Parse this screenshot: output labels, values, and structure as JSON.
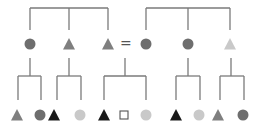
{
  "diagram": {
    "title": "",
    "colors": {
      "line": "#7a7a7a",
      "dark_gray": "#6e6e6e",
      "mid_gray": "#7f7f7f",
      "light_gray": "#c9c9c9",
      "black": "#1a1a1a",
      "outline": "#555555"
    },
    "equals_sign": "=",
    "top_brackets": [
      {
        "name": "left-group",
        "x1": 30,
        "x2": 108,
        "mid": 69,
        "y_top": 8,
        "y_bottom": 30
      },
      {
        "name": "right-group",
        "x1": 146,
        "x2": 230,
        "mid": 188,
        "y_top": 8,
        "y_bottom": 30
      }
    ],
    "middle_row": [
      {
        "shape": "circle",
        "color": "dark_gray",
        "x": 30,
        "y": 44
      },
      {
        "shape": "triangle",
        "color": "mid_gray",
        "x": 69,
        "y": 44
      },
      {
        "shape": "triangle",
        "color": "mid_gray",
        "x": 108,
        "y": 44
      },
      {
        "shape": "circle",
        "color": "dark_gray",
        "x": 146,
        "y": 44
      },
      {
        "shape": "circle",
        "color": "dark_gray",
        "x": 188,
        "y": 44
      },
      {
        "shape": "triangle",
        "color": "light_gray",
        "x": 230,
        "y": 44
      }
    ],
    "lower_brackets": [
      {
        "stem_x": 30,
        "x1": 18,
        "x2": 41
      },
      {
        "stem_x": 69,
        "x1": 57,
        "x2": 81
      },
      {
        "stem_x": 125,
        "x1": 104,
        "x2": 146
      },
      {
        "stem_x": 188,
        "x1": 176,
        "x2": 200
      },
      {
        "stem_x": 231,
        "x1": 220,
        "x2": 244
      }
    ],
    "bottom_row": [
      {
        "shape": "triangle",
        "color": "mid_gray",
        "x": 17,
        "y": 115
      },
      {
        "shape": "circle",
        "color": "dark_gray",
        "x": 40,
        "y": 115
      },
      {
        "shape": "triangle",
        "color": "black",
        "x": 54,
        "y": 115
      },
      {
        "shape": "circle",
        "color": "light_gray",
        "x": 80,
        "y": 115
      },
      {
        "shape": "triangle",
        "color": "black",
        "x": 104,
        "y": 115
      },
      {
        "shape": "square",
        "color": "outline",
        "x": 124,
        "y": 115
      },
      {
        "shape": "circle",
        "color": "light_gray",
        "x": 146,
        "y": 115
      },
      {
        "shape": "triangle",
        "color": "black",
        "x": 176,
        "y": 115
      },
      {
        "shape": "circle",
        "color": "light_gray",
        "x": 199,
        "y": 115
      },
      {
        "shape": "triangle",
        "color": "mid_gray",
        "x": 218,
        "y": 115
      },
      {
        "shape": "circle",
        "color": "dark_gray",
        "x": 243,
        "y": 115
      }
    ]
  }
}
